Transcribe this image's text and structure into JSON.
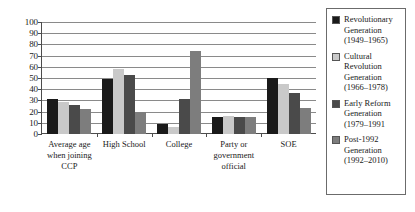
{
  "chart_data": {
    "type": "bar",
    "title": "",
    "xlabel": "",
    "ylabel": "",
    "ylim": [
      0,
      100
    ],
    "yticks": [
      0,
      10,
      20,
      30,
      40,
      50,
      60,
      70,
      80,
      90,
      100
    ],
    "grid": true,
    "legend_position": "right",
    "categories": [
      "Average age when joining CCP",
      "High School",
      "College",
      "Party or government official",
      "SOE"
    ],
    "series": [
      {
        "name": "Revolutionary Generation (1949–1965)",
        "color": "#1a1a1a",
        "values": [
          31,
          49,
          9,
          15,
          50
        ]
      },
      {
        "name": "Cultural Revolution Generation (1966–1978)",
        "color": "#c9c9c9",
        "values": [
          29,
          58,
          6,
          16,
          45
        ]
      },
      {
        "name": "Early Reform Generation (1979–1991",
        "color": "#4a4a4a",
        "values": [
          26,
          53,
          31,
          15,
          37
        ]
      },
      {
        "name": "Post-1992 Generation (1992–2010)",
        "color": "#7d7d7d",
        "values": [
          22,
          20,
          74,
          15,
          23
        ]
      }
    ]
  },
  "axis": {
    "y_tick_labels": [
      "100",
      "90",
      "80",
      "70",
      "60",
      "50",
      "40",
      "30",
      "20",
      "10",
      "0"
    ]
  },
  "x_axis": {
    "labels": [
      "Average age when joining CCP",
      "High School",
      "College",
      "Party or government official",
      "SOE"
    ]
  },
  "legend": {
    "entries": [
      {
        "label": "Revolutionary Generation (1949–1965)",
        "color": "#1a1a1a",
        "swatch_name": "legend-swatch-revolutionary"
      },
      {
        "label": "Cultural Revolution Generation (1966–1978)",
        "color": "#c9c9c9",
        "swatch_name": "legend-swatch-cultural-revolution"
      },
      {
        "label": "Early Reform Generation (1979–1991",
        "color": "#4a4a4a",
        "swatch_name": "legend-swatch-early-reform"
      },
      {
        "label": "Post-1992 Generation (1992–2010)",
        "color": "#7d7d7d",
        "swatch_name": "legend-swatch-post-1992"
      }
    ]
  }
}
